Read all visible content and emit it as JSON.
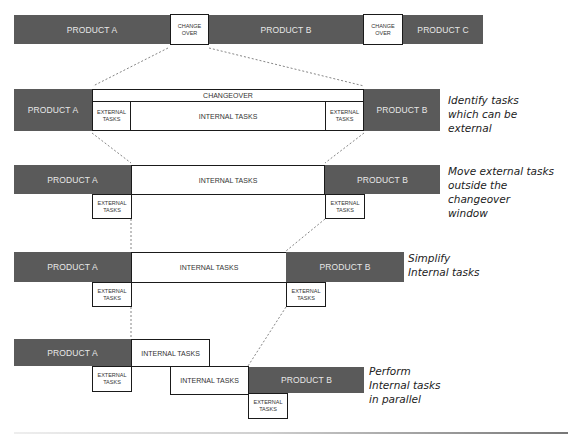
{
  "colors": {
    "product_fill": "#5a5a5a",
    "product_text": "#e8e8e8",
    "task_border": "#1a1a1a"
  },
  "row1": {
    "product_a": "PRODUCT A",
    "changeover_1": "CHANGE\nOVER",
    "product_b": "PRODUCT B",
    "changeover_2": "CHANGE\nOVER",
    "product_c": "PRODUCT C"
  },
  "row2": {
    "product_a": "PRODUCT A",
    "changeover_header": "CHANGEOVER",
    "external_left": "EXTERNAL\nTASKS",
    "internal": "INTERNAL TASKS",
    "external_right": "EXTERNAL\nTASKS",
    "product_b": "PRODUCT B",
    "note": "Identify tasks\nwhich can be\nexternal"
  },
  "row3": {
    "product_a": "PRODUCT A",
    "internal": "INTERNAL TASKS",
    "product_b": "PRODUCT B",
    "external_left": "EXTERNAL\nTASKS",
    "external_right": "EXTERNAL\nTASKS",
    "note": "Move external tasks\noutside the changeover\nwindow"
  },
  "row4": {
    "product_a": "PRODUCT A",
    "internal": "INTERNAL TASKS",
    "product_b": "PRODUCT B",
    "external_left": "EXTERNAL\nTASKS",
    "external_right": "EXTERNAL\nTASKS",
    "note": "Simplify\nInternal tasks"
  },
  "row5": {
    "product_a": "PRODUCT A",
    "internal_1": "INTERNAL TASKS",
    "internal_2": "INTERNAL TASKS",
    "product_b": "PRODUCT B",
    "external_left": "EXTERNAL\nTASKS",
    "external_right": "EXTERNAL\nTASKS",
    "note": "Perform\nInternal tasks\nin parallel"
  }
}
